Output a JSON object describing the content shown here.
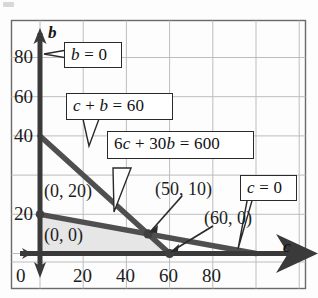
{
  "figure": {
    "background_color": "#fdfdfd",
    "frame_color": "#555555",
    "grid_color": "#b8b8b8",
    "axis_color": "#3a3a3a",
    "line_color": "#4a4a4a",
    "shade_color": "#e6e6e6"
  },
  "axes": {
    "x_name": "c",
    "y_name": "b",
    "x_ticks": [
      "0",
      "20",
      "40",
      "60",
      "80"
    ],
    "x_tick_values": [
      0,
      20,
      40,
      60,
      80
    ],
    "y_ticks": [
      "20",
      "40",
      "60",
      "80"
    ],
    "y_tick_values": [
      20,
      40,
      60,
      80
    ],
    "origin_label": "0",
    "xlim": [
      -10,
      105
    ],
    "ylim": [
      -10,
      92
    ],
    "grid": true
  },
  "callouts": [
    {
      "id": "b-zero",
      "text": "b = 0",
      "math": "<i>b</i> = 0"
    },
    {
      "id": "c-plus-b",
      "text": "c + b = 60",
      "math": "<i>c</i> + <i>b</i> = 60"
    },
    {
      "id": "six-c",
      "text": "6c + 30b = 600",
      "math": "6<i>c</i> + 30<i>b</i> = 600"
    },
    {
      "id": "c-zero",
      "text": "c = 0",
      "math": "<i>c</i> = 0"
    }
  ],
  "vertex_labels": [
    {
      "id": "v-0-0",
      "text": "(0, 0)"
    },
    {
      "id": "v-0-20",
      "text": "(0, 20)"
    },
    {
      "id": "v-50-10",
      "text": "(50, 10)"
    },
    {
      "id": "v-60-0",
      "text": "(60, 0)"
    }
  ],
  "chart_data": {
    "type": "line",
    "xlabel": "c",
    "ylabel": "b",
    "xlim": [
      -10,
      105
    ],
    "ylim": [
      -10,
      92
    ],
    "xticks": [
      0,
      20,
      40,
      60,
      80
    ],
    "yticks": [
      20,
      40,
      60,
      80
    ],
    "grid": true,
    "legend": "none",
    "series": [
      {
        "name": "c + b = 60",
        "equation": "c + b = 60",
        "x": [
          0,
          60
        ],
        "y": [
          60,
          0
        ],
        "intercepts": {
          "b": 60,
          "c": 60
        }
      },
      {
        "name": "6c + 30b = 600",
        "equation": "6c + 30b = 600",
        "x": [
          0,
          100
        ],
        "y": [
          20,
          0
        ],
        "intercepts": {
          "b": 20,
          "c": 100
        }
      },
      {
        "name": "b = 0",
        "equation": "b = 0",
        "x": [
          -10,
          105
        ],
        "y": [
          0,
          0
        ]
      },
      {
        "name": "c = 0",
        "equation": "c = 0",
        "x": [
          0,
          0
        ],
        "y": [
          -10,
          92
        ]
      }
    ],
    "shaded_region": {
      "label": "feasible region",
      "fill": "#e6e6e6",
      "vertices": [
        [
          0,
          0
        ],
        [
          0,
          20
        ],
        [
          50,
          10
        ],
        [
          60,
          0
        ]
      ]
    },
    "annotations": [
      {
        "text": "(0, 0)",
        "x": 0,
        "y": 0
      },
      {
        "text": "(0, 20)",
        "x": 0,
        "y": 20
      },
      {
        "text": "(50, 10)",
        "x": 50,
        "y": 10
      },
      {
        "text": "(60, 0)",
        "x": 60,
        "y": 0
      },
      {
        "text": "b = 0",
        "points_to": [
          0,
          80
        ]
      },
      {
        "text": "c + b = 60",
        "points_to": [
          20,
          40
        ]
      },
      {
        "text": "6c + 30b = 600",
        "points_to": [
          33,
          13
        ]
      },
      {
        "text": "c = 0",
        "points_to": [
          86,
          0
        ]
      }
    ]
  }
}
